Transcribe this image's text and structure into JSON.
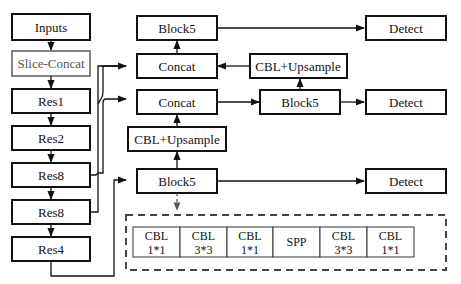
{
  "diagram": {
    "backbone": [
      {
        "id": "inputs",
        "label": "Inputs"
      },
      {
        "id": "slice_concat",
        "label": "Slice-Concat"
      },
      {
        "id": "res1",
        "label": "Res1"
      },
      {
        "id": "res2",
        "label": "Res2"
      },
      {
        "id": "res8_a",
        "label": "Res8"
      },
      {
        "id": "res8_b",
        "label": "Res8"
      },
      {
        "id": "res4",
        "label": "Res4"
      }
    ],
    "neck": {
      "block5_top": "Block5",
      "concat_top": "Concat",
      "concat_mid": "Concat",
      "cbl_upsample_left": "CBL+Upsample",
      "block5_bottom": "Block5",
      "cbl_upsample_right": "CBL+Upsample",
      "block5_mid": "Block5"
    },
    "heads": [
      {
        "id": "detect_top",
        "label": "Detect"
      },
      {
        "id": "detect_mid",
        "label": "Detect"
      },
      {
        "id": "detect_bottom",
        "label": "Detect"
      }
    ],
    "block5_detail": [
      {
        "line1": "CBL",
        "line2": "1*1"
      },
      {
        "line1": "CBL",
        "line2": "3*3"
      },
      {
        "line1": "CBL",
        "line2": "1*1"
      },
      {
        "line1": "SPP",
        "line2": ""
      },
      {
        "line1": "CBL",
        "line2": "3*3"
      },
      {
        "line1": "CBL",
        "line2": "1*1"
      }
    ]
  }
}
